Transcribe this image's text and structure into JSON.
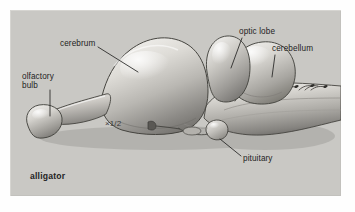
{
  "figure": {
    "species": "alligator",
    "scale": "×1/2",
    "background_color": "#c9c8c4",
    "text_color": "#232323",
    "frame": {
      "x": 10,
      "y": 10,
      "width": 331,
      "height": 186
    }
  },
  "labels": [
    {
      "id": "cerebrum",
      "text": "cerebrum",
      "x": 50,
      "y": 29,
      "leader": {
        "x1": 88,
        "y1": 38,
        "x2": 128,
        "y2": 62
      }
    },
    {
      "id": "olfactory",
      "text": "olfactory\nbulb",
      "x": 12,
      "y": 62,
      "leader": {
        "x1": 40,
        "y1": 80,
        "x2": 40,
        "y2": 105
      }
    },
    {
      "id": "optic_lobe",
      "text": "optic lobe",
      "x": 229,
      "y": 17,
      "leader": {
        "x1": 232,
        "y1": 27,
        "x2": 222,
        "y2": 58
      }
    },
    {
      "id": "cerebellum",
      "text": "cerebellum",
      "x": 262,
      "y": 34,
      "leader": {
        "x1": 265,
        "y1": 44,
        "x2": 263,
        "y2": 66
      }
    },
    {
      "id": "pituitary",
      "text": "pituitary",
      "x": 233,
      "y": 144,
      "leader": {
        "x1": 231,
        "y1": 146,
        "x2": 211,
        "y2": 129
      }
    }
  ],
  "structures": [
    "olfactory bulb",
    "olfactory tract",
    "cerebrum",
    "optic lobe",
    "cerebellum",
    "pituitary",
    "medulla oblongata",
    "cranial nerve roots"
  ],
  "illustration": {
    "style": "airbrushed grayscale anatomical drawing",
    "view": "lateral (side) view of brain",
    "fill_light": "#eceae6",
    "fill_mid": "#b5b3ae",
    "fill_dark": "#6f6e6b",
    "outline": "#3c3b39"
  }
}
